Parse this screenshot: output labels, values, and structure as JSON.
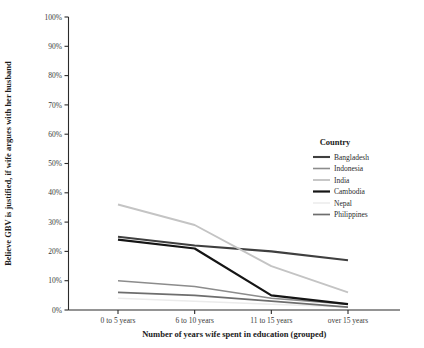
{
  "chart_data": {
    "type": "line",
    "title": "",
    "xlabel": "Number of years wife spent in education (grouped)",
    "ylabel": "Believe GBV is justified, if wife argues with her husband",
    "categories": [
      "0 to 5 years",
      "6 to 10 years",
      "11 to 15 years",
      "over 15 years"
    ],
    "ylim": [
      0,
      100
    ],
    "ytick_labels": [
      "0%",
      "10%",
      "20%",
      "30%",
      "40%",
      "50%",
      "60%",
      "70%",
      "80%",
      "90%",
      "100%"
    ],
    "ytick_values": [
      0,
      10,
      20,
      30,
      40,
      50,
      60,
      70,
      80,
      90,
      100
    ],
    "grid": false,
    "legend_position": "right",
    "legend_title": "Country",
    "series": [
      {
        "name": "Bangladesh",
        "values": [
          25,
          22,
          20,
          17
        ],
        "color": "#3f3f3f"
      },
      {
        "name": "Indonesia",
        "values": [
          10,
          8,
          4,
          2
        ],
        "color": "#8c8c8c"
      },
      {
        "name": "India",
        "values": [
          36,
          29,
          15,
          6
        ],
        "color": "#c4c4c4"
      },
      {
        "name": "Cambodia",
        "values": [
          24,
          21,
          5,
          2
        ],
        "color": "#151515"
      },
      {
        "name": "Nepal",
        "values": [
          4,
          3,
          2,
          1
        ],
        "color": "#ebebeb"
      },
      {
        "name": "Philippines",
        "values": [
          6,
          5,
          3,
          1
        ],
        "color": "#6e6e6e"
      }
    ]
  }
}
